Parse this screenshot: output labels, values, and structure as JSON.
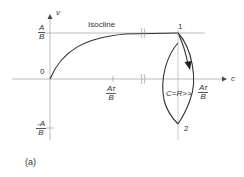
{
  "diagram": {
    "axes": {
      "x_label": "c",
      "y_label": "v"
    },
    "curve_label": "Isocline",
    "y_ticks": {
      "top": {
        "num": "A",
        "den": "B"
      },
      "origin": "0",
      "bottom": {
        "num": "-A",
        "den": "B"
      }
    },
    "x_ticks": {
      "mid": {
        "num": "Aτ",
        "den": "B"
      },
      "right_prefix": "C=R>>",
      "right": {
        "num": "Aτ",
        "den": "B"
      }
    },
    "points": {
      "p1": "1",
      "p2": "2"
    },
    "panel_label": "(a)",
    "colors": {
      "line": "#333333",
      "axis": "#999999"
    }
  }
}
